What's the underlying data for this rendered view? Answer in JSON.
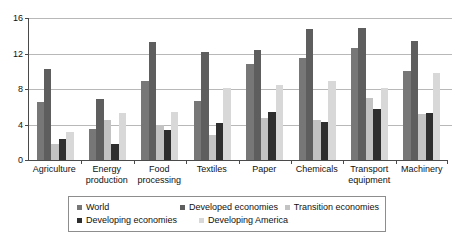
{
  "chart_data": {
    "type": "bar",
    "title": "",
    "subtitle": "",
    "xlabel": "",
    "ylabel": "",
    "ylim": [
      0,
      16
    ],
    "yticks": [
      0,
      4,
      8,
      12,
      16
    ],
    "grid": true,
    "legend_position": "bottom",
    "categories": [
      "Agriculture",
      "Energy production",
      "Food processing",
      "Textiles",
      "Paper",
      "Chemicals",
      "Transport equipment",
      "Machinery"
    ],
    "category_lines": [
      [
        "Agriculture"
      ],
      [
        "Energy",
        "production"
      ],
      [
        "Food",
        "processing"
      ],
      [
        "Textiles"
      ],
      [
        "Paper"
      ],
      [
        "Chemicals"
      ],
      [
        "Transport",
        "equipment"
      ],
      [
        "Machinery"
      ]
    ],
    "series": [
      {
        "name": "World",
        "color": "#777777",
        "values": [
          6.5,
          3.5,
          8.9,
          6.6,
          10.8,
          11.5,
          12.6,
          10.0
        ]
      },
      {
        "name": "Developed economies",
        "color": "#5e5e5e",
        "values": [
          10.3,
          6.9,
          13.3,
          12.2,
          12.4,
          14.8,
          14.9,
          13.4
        ]
      },
      {
        "name": "Transition economies",
        "color": "#c3c3c3",
        "values": [
          1.8,
          4.5,
          4.0,
          2.8,
          4.7,
          4.5,
          7.0,
          5.2
        ]
      },
      {
        "name": "Developing economies",
        "color": "#2e2e2e",
        "values": [
          2.4,
          1.8,
          3.4,
          4.2,
          5.4,
          4.3,
          5.8,
          5.3
        ]
      },
      {
        "name": "Developing America",
        "color": "#d8d8d8",
        "values": [
          3.2,
          5.3,
          5.4,
          8.1,
          8.4,
          8.9,
          8.1,
          9.8
        ]
      }
    ]
  },
  "legend": {
    "rows": [
      [
        "World",
        "Developed economies",
        "Transition economies"
      ],
      [
        "Developing economies",
        "Developing America"
      ]
    ]
  }
}
